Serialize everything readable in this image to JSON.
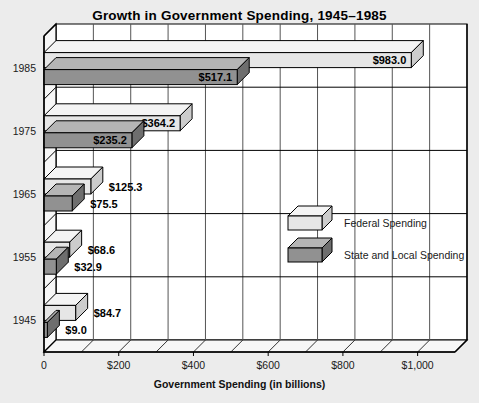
{
  "chart_data": {
    "type": "bar",
    "orientation": "horizontal",
    "title": "Growth in Government Spending, 1945–1985",
    "xlabel": "Government Spending (in billions)",
    "ylabel": "",
    "categories": [
      "1985",
      "1975",
      "1965",
      "1955",
      "1945"
    ],
    "series": [
      {
        "name": "Federal Spending",
        "color": "#e6e6e6",
        "values": [
          983.0,
          364.2,
          125.3,
          68.6,
          84.7
        ],
        "labels": [
          "$983.0",
          "$364.2",
          "$125.3",
          "$68.6",
          "$84.7"
        ]
      },
      {
        "name": "State and Local Spending",
        "color": "#919191",
        "values": [
          517.1,
          235.2,
          75.5,
          32.9,
          9.0
        ],
        "labels": [
          "$517.1",
          "$235.2",
          "$75.5",
          "$32.9",
          "$9.0"
        ]
      }
    ],
    "xlim": [
      0,
      1100
    ],
    "xticks": [
      0,
      200,
      400,
      600,
      800,
      1000
    ],
    "xticklabels": [
      "0",
      "$200",
      "$400",
      "$600",
      "$800",
      "$1,000"
    ],
    "minor_tick_interval": 100,
    "grid": true,
    "grid_axis": "x",
    "legend_position": "center-right",
    "style": "3d-isometric"
  },
  "legend": {
    "items": [
      {
        "label": "Federal Spending",
        "swatch": "light-3d-box"
      },
      {
        "label": "State and Local Spending",
        "swatch": "dark-3d-box"
      }
    ]
  },
  "colors": {
    "background": "#ececec",
    "plot_background": "#ffffff",
    "federal_face": "#e6e6e6",
    "federal_top": "#f4f4f4",
    "federal_side": "#cccccc",
    "state_face": "#919191",
    "state_top": "#b5b5b5",
    "state_side": "#6e6e6e",
    "axis": "#000000",
    "gridline": "#555555"
  }
}
